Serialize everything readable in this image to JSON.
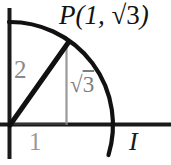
{
  "figure": {
    "type": "unit-circle-diagram",
    "background_color": "#ffffff",
    "labels": {
      "point_label_prefix": "P(1, ",
      "point_label_radical": "√",
      "point_label_radicand": "3",
      "point_label_suffix": ")",
      "point_label_full": "P(1, √3)",
      "radius_label": "2",
      "horizontal_leg_label": "1",
      "vertical_leg_radical": "√",
      "vertical_leg_radicand": "3",
      "vertical_leg_label_full": "√3",
      "axis_point_label": "I"
    },
    "colors": {
      "axis": "#1a1a1a",
      "arc": "#111111",
      "radius_line": "#111111",
      "guide_line": "#999999",
      "gray_text": "#8a8a8a",
      "black_text": "#121212"
    },
    "geometry": {
      "origin_x": 9,
      "origin_y": 125,
      "circle_radius": 103,
      "point_p_x": 67,
      "point_p_y": 44,
      "x_axis_intercept_x": 112,
      "y_axis_intercept_y": 22
    }
  }
}
